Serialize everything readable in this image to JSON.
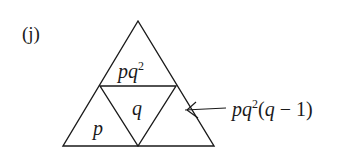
{
  "label": "(j)",
  "diagram": {
    "type": "subdivided-triangle",
    "regions": {
      "top": {
        "base": "p",
        "sup": "q",
        "exp": "2"
      },
      "left": "p",
      "center": "q",
      "right_label": {
        "base": "p",
        "sup_var": "q",
        "exp": "2",
        "tail_open": "(",
        "tail_var": "q",
        "tail_rest": " − 1)"
      }
    },
    "arrow_target": "right"
  }
}
